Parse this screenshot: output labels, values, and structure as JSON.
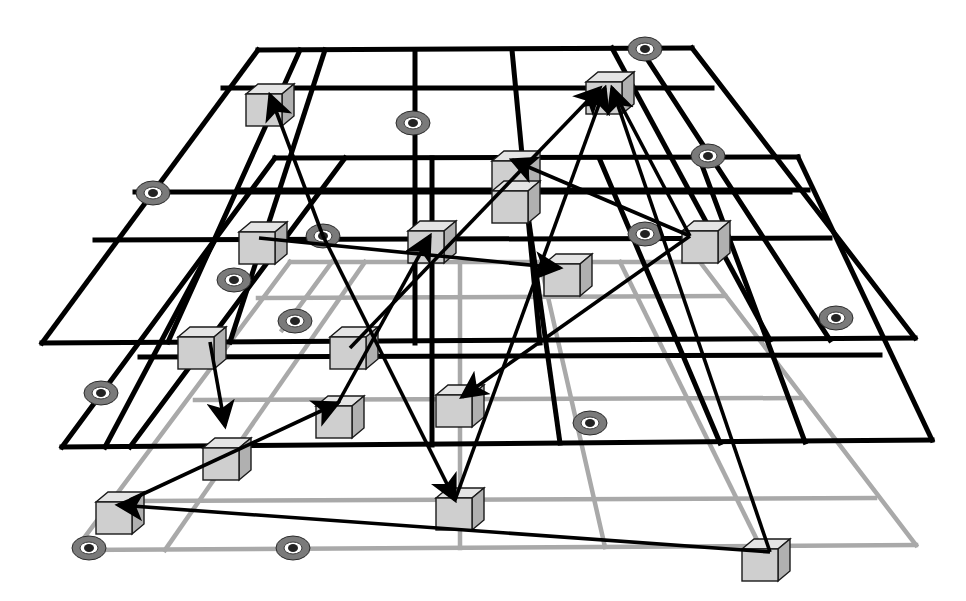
{
  "diagram": {
    "title": "",
    "colors": {
      "background": "#ffffff",
      "grid_upper": "#000000",
      "grid_lower": "#a9a9a9",
      "cube_front": "#cfcfcf",
      "cube_top": "#e4e4e4",
      "cube_side": "#b0b0b0",
      "ring": "#7a7a7a",
      "arrow": "#000000"
    },
    "layers": [
      {
        "name": "top-layer",
        "style": "black",
        "outline": [
          [
            258,
            50
          ],
          [
            692,
            48
          ],
          [
            915,
            338
          ],
          [
            42,
            343
          ]
        ],
        "lines": [
          [
            [
              223,
              88
            ],
            [
              712,
              88
            ]
          ],
          [
            [
              135,
              192
            ],
            [
              790,
              192
            ]
          ],
          [
            [
              95,
              240
            ],
            [
              830,
              238
            ]
          ],
          [
            [
              300,
              50
            ],
            [
              168,
              342
            ]
          ],
          [
            [
              325,
              50
            ],
            [
              230,
              342
            ]
          ],
          [
            [
              415,
              50
            ],
            [
              415,
              343
            ]
          ],
          [
            [
              512,
              50
            ],
            [
              540,
              343
            ]
          ],
          [
            [
              612,
              48
            ],
            [
              770,
              340
            ]
          ],
          [
            [
              640,
              48
            ],
            [
              830,
              340
            ]
          ]
        ]
      },
      {
        "name": "middle-layer",
        "style": "black",
        "outline": [
          [
            275,
            158
          ],
          [
            798,
            157
          ],
          [
            932,
            440
          ],
          [
            62,
            447
          ]
        ],
        "lines": [
          [
            [
              240,
              190
            ],
            [
              808,
              190
            ]
          ],
          [
            [
              140,
              357
            ],
            [
              880,
              355
            ]
          ],
          [
            [
              345,
              158
            ],
            [
              130,
              447
            ]
          ],
          [
            [
              432,
              158
            ],
            [
              432,
              445
            ]
          ],
          [
            [
              520,
              158
            ],
            [
              560,
              443
            ]
          ],
          [
            [
              600,
              160
            ],
            [
              720,
              443
            ]
          ],
          [
            [
              700,
              160
            ],
            [
              805,
              442
            ]
          ],
          [
            [
              215,
              240
            ],
            [
              105,
              447
            ]
          ]
        ]
      },
      {
        "name": "bottom-layer",
        "style": "gray",
        "outline": [
          [
            290,
            262
          ],
          [
            700,
            262
          ],
          [
            916,
            545
          ],
          [
            75,
            550
          ]
        ],
        "lines": [
          [
            [
              258,
              298
            ],
            [
              725,
              296
            ]
          ],
          [
            [
              195,
              400
            ],
            [
              800,
              398
            ]
          ],
          [
            [
              140,
              501
            ],
            [
              875,
              498
            ]
          ],
          [
            [
              365,
              262
            ],
            [
              165,
              550
            ]
          ],
          [
            [
              460,
              262
            ],
            [
              460,
              548
            ]
          ],
          [
            [
              540,
              262
            ],
            [
              605,
              547
            ]
          ],
          [
            [
              620,
              262
            ],
            [
              760,
              546
            ]
          ],
          [
            [
              332,
              262
            ],
            [
              282,
              330
            ]
          ]
        ]
      }
    ],
    "nodes": [
      {
        "id": "n1",
        "x": 246,
        "y": 84,
        "size": 36
      },
      {
        "id": "n2",
        "x": 586,
        "y": 72,
        "size": 36
      },
      {
        "id": "n3",
        "x": 492,
        "y": 151,
        "size": 36
      },
      {
        "id": "n4",
        "x": 492,
        "y": 181,
        "size": 36
      },
      {
        "id": "n5",
        "x": 239,
        "y": 222,
        "size": 36
      },
      {
        "id": "n6",
        "x": 408,
        "y": 221,
        "size": 36
      },
      {
        "id": "n7",
        "x": 682,
        "y": 221,
        "size": 36
      },
      {
        "id": "n8",
        "x": 544,
        "y": 254,
        "size": 36
      },
      {
        "id": "n9",
        "x": 178,
        "y": 327,
        "size": 36
      },
      {
        "id": "n10",
        "x": 330,
        "y": 327,
        "size": 36
      },
      {
        "id": "n11",
        "x": 436,
        "y": 385,
        "size": 36
      },
      {
        "id": "n12",
        "x": 316,
        "y": 396,
        "size": 36
      },
      {
        "id": "n13",
        "x": 203,
        "y": 438,
        "size": 36
      },
      {
        "id": "n14",
        "x": 96,
        "y": 492,
        "size": 36
      },
      {
        "id": "n15",
        "x": 436,
        "y": 488,
        "size": 36
      },
      {
        "id": "n16",
        "x": 742,
        "y": 539,
        "size": 36
      }
    ],
    "rings": [
      {
        "x": 645,
        "y": 49
      },
      {
        "x": 413,
        "y": 123
      },
      {
        "x": 708,
        "y": 156
      },
      {
        "x": 153,
        "y": 193
      },
      {
        "x": 323,
        "y": 236
      },
      {
        "x": 645,
        "y": 234
      },
      {
        "x": 234,
        "y": 280
      },
      {
        "x": 295,
        "y": 321
      },
      {
        "x": 836,
        "y": 318
      },
      {
        "x": 101,
        "y": 393
      },
      {
        "x": 590,
        "y": 423
      },
      {
        "x": 89,
        "y": 548
      },
      {
        "x": 293,
        "y": 548
      }
    ],
    "edges": [
      {
        "from": [
          323,
          236
        ],
        "to": [
          270,
          95
        ],
        "arrow": true
      },
      {
        "from": [
          259,
          238
        ],
        "to": [
          560,
          268
        ],
        "arrow": true
      },
      {
        "from": [
          690,
          236
        ],
        "to": [
          512,
          160
        ],
        "arrow": true
      },
      {
        "from": [
          690,
          236
        ],
        "to": [
          462,
          397
        ],
        "arrow": true
      },
      {
        "from": [
          455,
          500
        ],
        "to": [
          605,
          88
        ],
        "arrow": true
      },
      {
        "from": [
          770,
          552
        ],
        "to": [
          612,
          88
        ],
        "arrow": true
      },
      {
        "from": [
          350,
          348
        ],
        "to": [
          600,
          88
        ],
        "arrow": true
      },
      {
        "from": [
          338,
          403
        ],
        "to": [
          430,
          236
        ],
        "arrow": true
      },
      {
        "from": [
          210,
          342
        ],
        "to": [
          225,
          426
        ],
        "arrow": true
      },
      {
        "from": [
          323,
          236
        ],
        "to": [
          455,
          500
        ],
        "arrow": true
      },
      {
        "from": [
          130,
          500
        ],
        "to": [
          338,
          403
        ],
        "arrow": true,
        "double": false
      },
      {
        "from": [
          770,
          552
        ],
        "to": [
          118,
          505
        ],
        "arrow": true
      },
      {
        "from": [
          612,
          88
        ],
        "to": [
          690,
          236
        ],
        "arrow": false
      }
    ]
  }
}
